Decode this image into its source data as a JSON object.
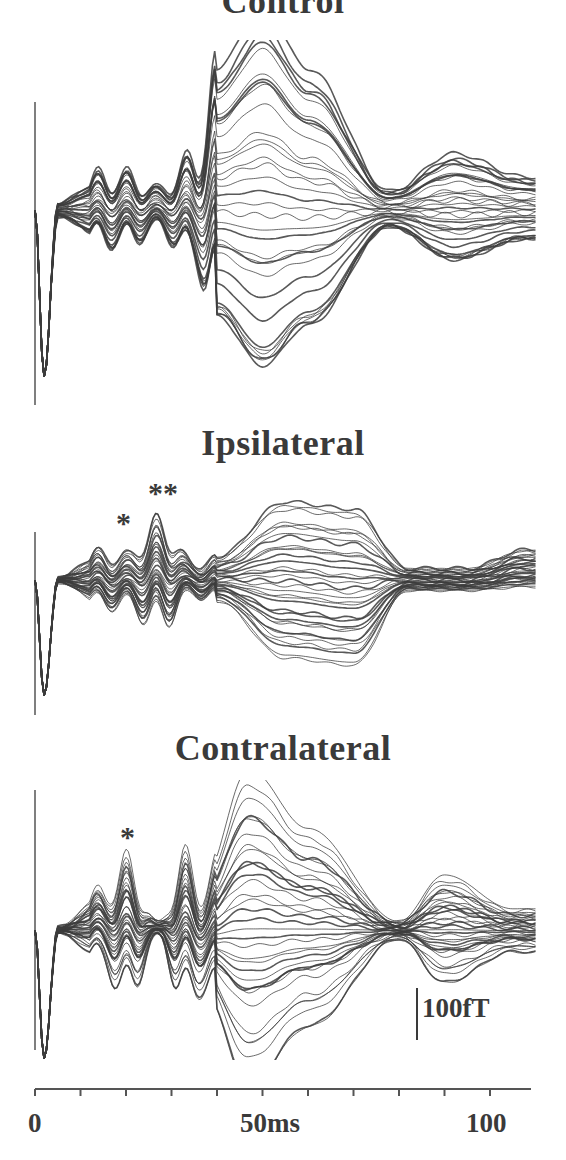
{
  "chart_data": {
    "type": "line",
    "xlabel": "ms",
    "xlim": [
      0,
      110
    ],
    "x_ticks": [
      0,
      10,
      20,
      30,
      40,
      50,
      60,
      70,
      80,
      90,
      100
    ],
    "x_tick_labels": [
      "0",
      "50ms",
      "100"
    ],
    "scale_bar": "100fT",
    "grid": false,
    "panels": [
      {
        "name": "Control",
        "annotations": [],
        "description": "Superimposed sensor waveforms; early artifact at ~1ms, small oscillatory peaks at ~15, 20, 27 ms, large divergence peaking ~50 ms (±~230 fT), second lobe ~90-95 ms",
        "envelope": {
          "x": [
            0,
            2,
            5,
            15,
            20,
            27,
            35,
            40,
            50,
            60,
            78,
            92,
            108
          ],
          "upper": [
            0,
            -170,
            10,
            40,
            40,
            25,
            60,
            150,
            215,
            150,
            20,
            60,
            35
          ],
          "lower": [
            0,
            -170,
            -10,
            -40,
            -40,
            -25,
            -60,
            -130,
            -190,
            -140,
            -20,
            -60,
            -35
          ]
        }
      },
      {
        "name": "Ipsilateral",
        "annotations": [
          {
            "label": "*",
            "x_ms": 20
          },
          {
            "label": "**",
            "x_ms": 27
          }
        ],
        "description": "Enhanced peaks at ~20 ms (*) and ~27 ms (**); broad divergence 40-75 ms; convergence ~82 ms",
        "envelope": {
          "x": [
            0,
            2,
            5,
            15,
            20,
            27,
            35,
            40,
            55,
            70,
            82,
            95,
            108
          ],
          "upper": [
            0,
            -160,
            5,
            40,
            35,
            80,
            25,
            30,
            100,
            90,
            15,
            15,
            40
          ],
          "lower": [
            0,
            -160,
            -5,
            -40,
            -40,
            -70,
            -25,
            -30,
            -110,
            -120,
            -15,
            -15,
            -10
          ]
        }
      },
      {
        "name": "Contralateral",
        "annotations": [
          {
            "label": "*",
            "x_ms": 20
          }
        ],
        "description": "Enhanced peak at ~20 ms (*); peaks at 33 ms; large divergence peaking ~46-50 ms; convergence ~80 ms; second lobe ~90 ms",
        "envelope": {
          "x": [
            0,
            2,
            5,
            15,
            20,
            27,
            33,
            37,
            47,
            60,
            80,
            90,
            105
          ],
          "upper": [
            0,
            -165,
            5,
            50,
            85,
            10,
            90,
            60,
            190,
            120,
            10,
            65,
            25
          ],
          "lower": [
            0,
            -165,
            -5,
            -40,
            -85,
            -10,
            -90,
            -70,
            -175,
            -110,
            -10,
            -60,
            -25
          ]
        }
      }
    ]
  },
  "panels": [
    {
      "title": "Control"
    },
    {
      "title": "Ipsilateral",
      "stars": [
        "*",
        "**"
      ]
    },
    {
      "title": "Contralateral",
      "stars": [
        "*"
      ]
    }
  ],
  "scale": {
    "label": "100fT"
  },
  "axis": {
    "labels": [
      "0",
      "50ms",
      "100"
    ]
  }
}
